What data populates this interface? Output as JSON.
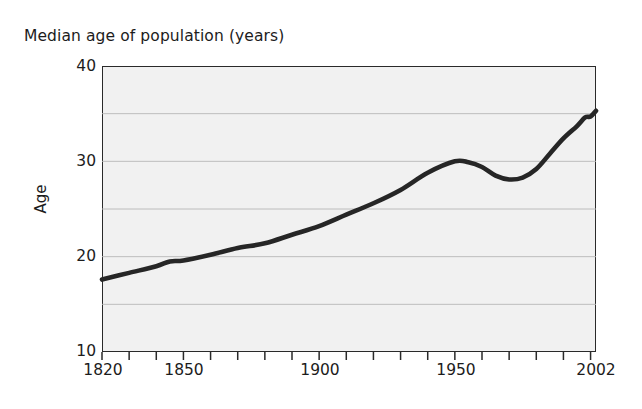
{
  "chart_data": {
    "type": "line",
    "title": "Median age of population (years)",
    "subtitle": "",
    "xlabel": "",
    "ylabel": "Age",
    "xlim": [
      1820,
      2002
    ],
    "ylim": [
      10,
      40
    ],
    "y_ticks": [
      10,
      20,
      30,
      40
    ],
    "y_tick_labels": [
      "10",
      "20",
      "30",
      "40"
    ],
    "y_gridlines": [
      15,
      20,
      25,
      30,
      35
    ],
    "x_ticks": [
      1820,
      1830,
      1840,
      1850,
      1860,
      1870,
      1880,
      1890,
      1900,
      1910,
      1920,
      1930,
      1940,
      1950,
      1960,
      1970,
      1980,
      1990,
      2000
    ],
    "x_tick_labels": [
      "1820",
      "1850",
      "1900",
      "1950",
      "2002"
    ],
    "x_labeled_positions": [
      1820,
      1850,
      1900,
      1950,
      2002
    ],
    "grid": true,
    "legend": "none",
    "series": [
      {
        "name": "Median age of population",
        "x": [
          1820,
          1830,
          1840,
          1845,
          1850,
          1860,
          1870,
          1880,
          1890,
          1900,
          1910,
          1920,
          1930,
          1940,
          1950,
          1955,
          1960,
          1965,
          1970,
          1975,
          1980,
          1985,
          1990,
          1995,
          1998,
          2000,
          2002
        ],
        "values": [
          17.6,
          18.3,
          19.0,
          19.5,
          19.6,
          20.2,
          20.9,
          21.4,
          22.3,
          23.2,
          24.4,
          25.6,
          27.0,
          28.8,
          30.0,
          29.9,
          29.4,
          28.5,
          28.1,
          28.3,
          29.2,
          30.8,
          32.4,
          33.7,
          34.6,
          34.7,
          35.3
        ],
        "color": "#262626"
      }
    ],
    "annotations": []
  },
  "figure": {
    "title": "Median age of population (years)",
    "y_axis_title": "Age",
    "y_tick_labels": [
      "40",
      "30",
      "20",
      "10"
    ],
    "x_tick_labels": [
      "1820",
      "1850",
      "1900",
      "1950",
      "2002"
    ],
    "plot_background_color": "#f1f1f1",
    "line_color": "#262626",
    "gridline_color": "#b7b7b7",
    "axis_color": "#2a2a2a"
  }
}
